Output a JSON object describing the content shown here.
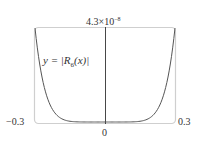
{
  "chart_data": {
    "type": "line",
    "title": "",
    "xlabel": "",
    "ylabel": "",
    "xlim": [
      -0.3,
      0.3
    ],
    "ylim": [
      0,
      4.3e-08
    ],
    "x_tick_labels": [
      "-0.3",
      "0",
      "0.3"
    ],
    "y_tick_labels": [
      "4.3×10^-8"
    ],
    "grid": false,
    "legend": null,
    "annotations": [
      "y = |R6(x)|"
    ],
    "series": [
      {
        "name": "y = |R6(x)|",
        "x": [
          -0.3,
          -0.27,
          -0.24,
          -0.21,
          -0.18,
          -0.15,
          -0.12,
          -0.09,
          -0.06,
          -0.03,
          0,
          0.03,
          0.06,
          0.09,
          0.12,
          0.15,
          0.18,
          0.21,
          0.24,
          0.27,
          0.3
        ],
        "values": [
          4.3e-08,
          2.17e-08,
          9.3e-09,
          3.2e-09,
          9.4e-10,
          2.1e-10,
          3.5e-11,
          3.4e-12,
          1.3e-13,
          5e-16,
          0,
          5e-16,
          1.3e-13,
          3.4e-12,
          3.5e-11,
          2.1e-10,
          9.4e-10,
          3.2e-09,
          9.3e-09,
          2.17e-08,
          4.3e-08
        ]
      }
    ]
  },
  "labels": {
    "ymax_base": "4.3×10",
    "ymax_exp": "−8",
    "xmin": "−0.3",
    "xmax": "0.3",
    "xzero": "0",
    "formula_prefix": "y = |R",
    "formula_sub": "6",
    "formula_suffix": "(x)|"
  },
  "colors": {
    "frame": "#cfcfcf",
    "axis": "#333333",
    "curve": "#555555"
  }
}
